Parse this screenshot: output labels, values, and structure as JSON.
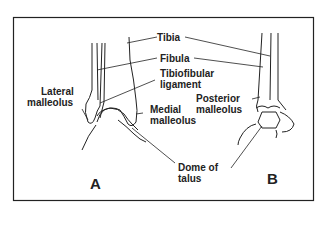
{
  "figure": {
    "panels": [
      {
        "id": "A",
        "label": "A"
      },
      {
        "id": "B",
        "label": "B"
      }
    ],
    "labels": {
      "tibia": "Tibia",
      "fibula": "Fibula",
      "tibiofibular_1": "Tibiofibular",
      "tibiofibular_2": "ligament",
      "lateral_1": "Lateral",
      "lateral_2": "malleolus",
      "medial_1": "Medial",
      "medial_2": "malleolus",
      "posterior_1": "Posterior",
      "posterior_2": "malleolus",
      "dome_1": "Dome of",
      "dome_2": "talus"
    }
  }
}
